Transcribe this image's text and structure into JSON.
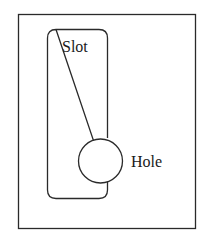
{
  "diagram": {
    "labels": {
      "slot": "Slot",
      "hole": "Hole"
    },
    "colors": {
      "stroke": "#2a2a2a",
      "background": "#ffffff"
    }
  }
}
